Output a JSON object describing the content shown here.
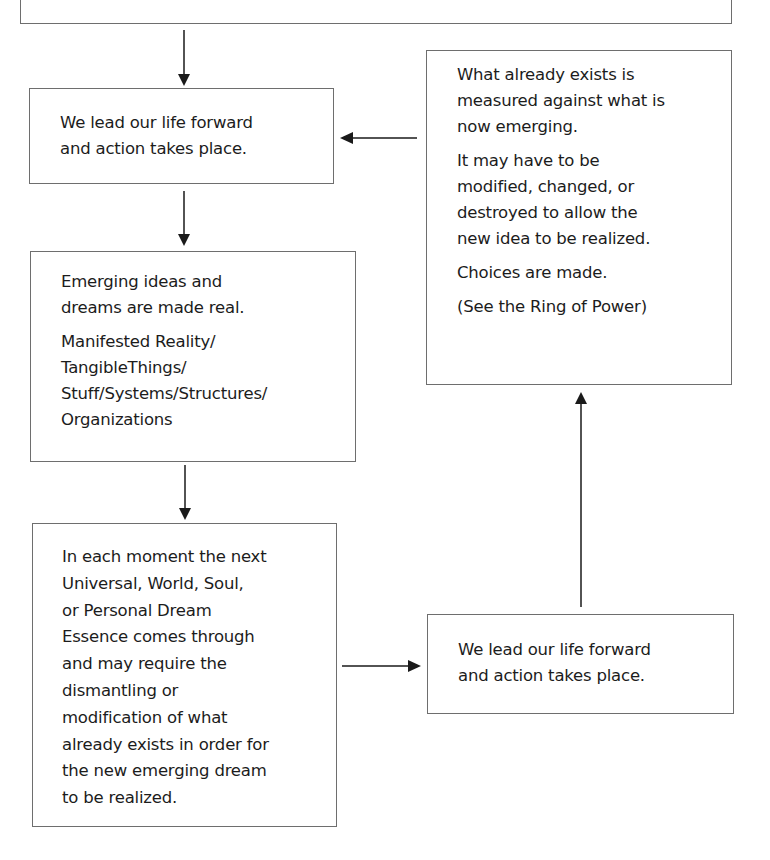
{
  "diagram": {
    "type": "flowchart",
    "top_box": {
      "text": "",
      "note": "cut off at top edge; text not legible"
    },
    "boxes": {
      "lead_life_1": {
        "lines": [
          "We lead our life forward",
          "and action takes place."
        ]
      },
      "emerging": {
        "para1": [
          "Emerging ideas and",
          "dreams are made real."
        ],
        "para2": [
          "Manifested Reality/",
          "TangibleThings/",
          "Stuff/Systems/Structures/",
          "Organizations"
        ]
      },
      "each_moment": {
        "lines": [
          "In each moment the next",
          "Universal, World, Soul,",
          "or Personal Dream",
          "Essence comes through",
          "and may require the",
          "dismantling or",
          "modification of what",
          "already exists in order for",
          "the new emerging dream",
          "to be realized."
        ]
      },
      "lead_life_2": {
        "lines": [
          "We lead our life forward",
          "and action takes place."
        ]
      },
      "measured": {
        "para1": [
          "What already exists is",
          "measured against what is",
          "now emerging."
        ],
        "para2": [
          "It may have to be",
          "modified, changed, or",
          "destroyed to allow the",
          "new idea to be realized."
        ],
        "para3": [
          "Choices are made."
        ],
        "para4": [
          "(See the Ring of Power)"
        ]
      }
    },
    "edges": [
      {
        "from": "top_box",
        "to": "lead_life_1",
        "direction": "down"
      },
      {
        "from": "lead_life_1",
        "to": "emerging",
        "direction": "down"
      },
      {
        "from": "emerging",
        "to": "each_moment",
        "direction": "down"
      },
      {
        "from": "each_moment",
        "to": "lead_life_2",
        "direction": "right"
      },
      {
        "from": "lead_life_2",
        "to": "measured",
        "direction": "up"
      },
      {
        "from": "measured",
        "to": "lead_life_1",
        "direction": "left"
      }
    ],
    "colors": {
      "border": "#6e6e6e",
      "text": "#1c1c1c",
      "arrow": "#1a1a1a",
      "background": "#ffffff"
    }
  }
}
